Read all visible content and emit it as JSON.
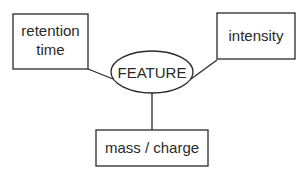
{
  "diagram": {
    "center": {
      "label": "FEATURE"
    },
    "nodes": [
      {
        "id": "retention-time",
        "lines": [
          "retention",
          "time"
        ]
      },
      {
        "id": "intensity",
        "lines": [
          "intensity"
        ]
      },
      {
        "id": "mass-charge",
        "lines": [
          "mass / charge"
        ]
      }
    ],
    "edges": [
      {
        "from": "FEATURE",
        "to": "retention-time"
      },
      {
        "from": "FEATURE",
        "to": "intensity"
      },
      {
        "from": "FEATURE",
        "to": "mass-charge"
      }
    ],
    "colors": {
      "stroke": "#2a2a2a",
      "background": "#ffffff"
    }
  }
}
